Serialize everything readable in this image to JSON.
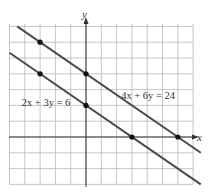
{
  "chart_data": {
    "type": "line",
    "title": "",
    "xlabel": "x",
    "ylabel": "y",
    "xlim": [
      -5,
      7
    ],
    "ylim": [
      -3,
      7
    ],
    "grid": true,
    "tick_labels_shown": false,
    "series": [
      {
        "name": "4x + 6y = 24",
        "equation": "y = 4 - (2/3)x",
        "color": "#4a4a4a",
        "extent_x": [
          -4.5,
          7.5
        ],
        "marked_points": [
          [
            -3,
            6
          ],
          [
            0,
            4
          ],
          [
            6,
            0
          ]
        ],
        "label_position": [
          2.3,
          2.4
        ]
      },
      {
        "name": "2x + 3y = 6",
        "equation": "y = 2 - (2/3)x",
        "color": "#4a4a4a",
        "extent_x": [
          -5,
          7.5
        ],
        "marked_points": [
          [
            -3,
            4
          ],
          [
            0,
            2
          ],
          [
            3,
            0
          ]
        ],
        "label_position": [
          -4.2,
          1.95
        ]
      }
    ]
  },
  "labels": {
    "x_axis": "x",
    "y_axis": "y",
    "line1": "4x + 6y = 24",
    "line2": "2x + 3y = 6"
  },
  "layout": {
    "origin_px": [
      86,
      137
    ],
    "unit_x_px": 15.3,
    "unit_y_px": 15.8,
    "grid_left_px": 9,
    "grid_top_px": 24,
    "grid_right_px": 193,
    "grid_bottom_px": 184
  }
}
